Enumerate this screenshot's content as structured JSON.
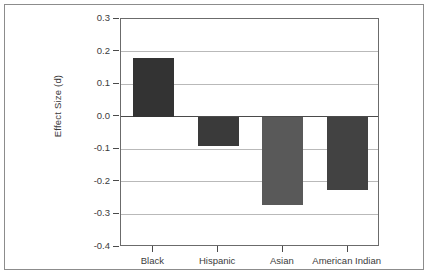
{
  "figure": {
    "background_color": "#ffffff",
    "frame_color": "#8c8c8c",
    "axis_color": "#4a4a4a",
    "gridline_color": "#b9b9b9"
  },
  "chart_data": {
    "type": "bar",
    "title": "",
    "subtitle": "",
    "xlabel": "",
    "ylabel": "Effect Size (d)",
    "categories": [
      "Black",
      "Hispanic",
      "Asian",
      "American Indian"
    ],
    "values": [
      0.18,
      -0.09,
      -0.27,
      -0.225
    ],
    "bar_colors": [
      "#333333",
      "#3a3a3a",
      "#595959",
      "#424242"
    ],
    "ylim": [
      -0.4,
      0.3
    ],
    "ytick_labels": [
      "0.3",
      "0.2",
      "0.1",
      "0.0",
      "-0.1",
      "-0.2",
      "-0.3",
      "-0.4"
    ],
    "ytick_values": [
      0.3,
      0.2,
      0.1,
      0.0,
      -0.1,
      -0.2,
      -0.3,
      -0.4
    ],
    "grid": true,
    "grid_axis": "y",
    "legend": false,
    "legend_position": "none",
    "zero_line": 0.0,
    "annotations": []
  }
}
